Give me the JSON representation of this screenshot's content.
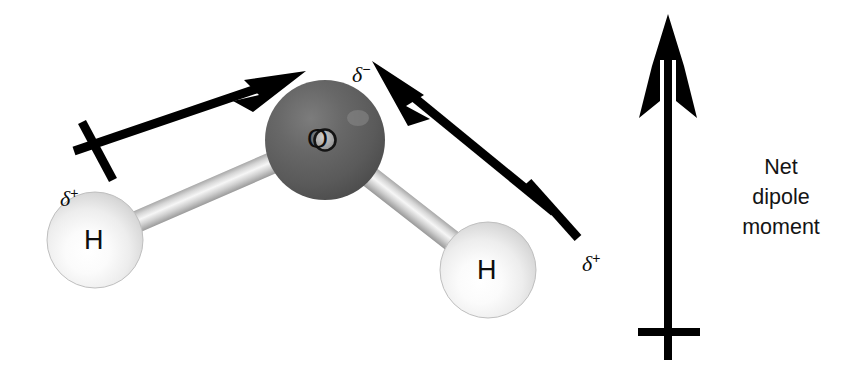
{
  "figure": {
    "background_color": "#ffffff"
  },
  "molecule": {
    "atoms": [
      {
        "id": "oxygen",
        "symbol": "O",
        "element": "oxygen",
        "color": "#585858",
        "highlight_color": "#8d8d8d",
        "cx": 325,
        "cy": 140,
        "r": 60,
        "charge_label": "δ",
        "charge_sign": "−"
      },
      {
        "id": "hydrogen-left",
        "symbol": "H",
        "element": "hydrogen",
        "color": "#f2f2f2",
        "highlight_color": "#ffffff",
        "cx": 95,
        "cy": 240,
        "r": 48,
        "charge_label": "δ",
        "charge_sign": "+"
      },
      {
        "id": "hydrogen-right",
        "symbol": "H",
        "element": "hydrogen",
        "color": "#f2f2f2",
        "highlight_color": "#ffffff",
        "cx": 488,
        "cy": 270,
        "r": 48,
        "charge_label": "δ",
        "charge_sign": "+"
      }
    ],
    "bonds": [
      {
        "id": "bond-o-h-left",
        "from": "oxygen",
        "to": "hydrogen-left",
        "color": "#c9c9c9"
      },
      {
        "id": "bond-o-h-right",
        "from": "oxygen",
        "to": "hydrogen-right",
        "color": "#c9c9c9"
      }
    ]
  },
  "charge_labels": {
    "oxygen_delta": {
      "text": "δ",
      "sign": "−",
      "x": 330,
      "y": 38
    },
    "hydrogen_left_delta": {
      "text": "δ",
      "sign": "+",
      "x": 38,
      "y": 160
    },
    "hydrogen_right_delta": {
      "text": "δ",
      "sign": "+",
      "x": 560,
      "y": 225
    }
  },
  "dipole_arrows": [
    {
      "id": "bond-dipole-left",
      "description": "bond dipole pointing from left hydrogen toward oxygen",
      "tail_x": 72,
      "tail_y": 152,
      "tip_x": 306,
      "tip_y": 72,
      "color": "#000000",
      "has_tail_crossbar": true
    },
    {
      "id": "bond-dipole-right",
      "description": "bond dipole pointing from right hydrogen toward oxygen",
      "tail_x": 556,
      "tail_y": 213,
      "tip_x": 372,
      "tip_y": 62,
      "color": "#000000",
      "has_tail_crossbar": true
    }
  ],
  "net_dipole": {
    "arrow": {
      "id": "net-dipole-arrow",
      "direction": "up",
      "tail_x": 668,
      "tail_y": 360,
      "tip_x": 668,
      "tip_y": 14,
      "color": "#000000",
      "has_tail_crossbar": true
    },
    "caption_lines": [
      "Net",
      "dipole",
      "moment"
    ]
  }
}
